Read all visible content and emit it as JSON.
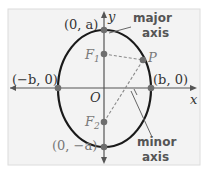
{
  "diagram": {
    "type": "ellipse-vertical-major-axis",
    "colors": {
      "panel": "#f3f3f3",
      "panel_border": "#dcdcdc",
      "ellipse": "#1a1a1a",
      "axes": "#555555",
      "points": "#6e6e6e",
      "dashed": "#8a8a8a",
      "text": "#333333",
      "foci_text": "#7a7a7a",
      "callout_text": "#5a5a5a"
    },
    "axes": {
      "x_label": "x",
      "y_label": "y",
      "origin_label": "O"
    },
    "vertices": {
      "top": "(0, a)",
      "bottom": "(0, −a)",
      "left": "(−b, 0)",
      "right": "(b, 0)"
    },
    "foci": {
      "f1": "F",
      "f1_sub": "1",
      "f2": "F",
      "f2_sub": "2"
    },
    "point": "P",
    "callouts": {
      "major_line1": "major",
      "major_line2": "axis",
      "minor_line1": "minor",
      "minor_line2": "axis"
    }
  }
}
